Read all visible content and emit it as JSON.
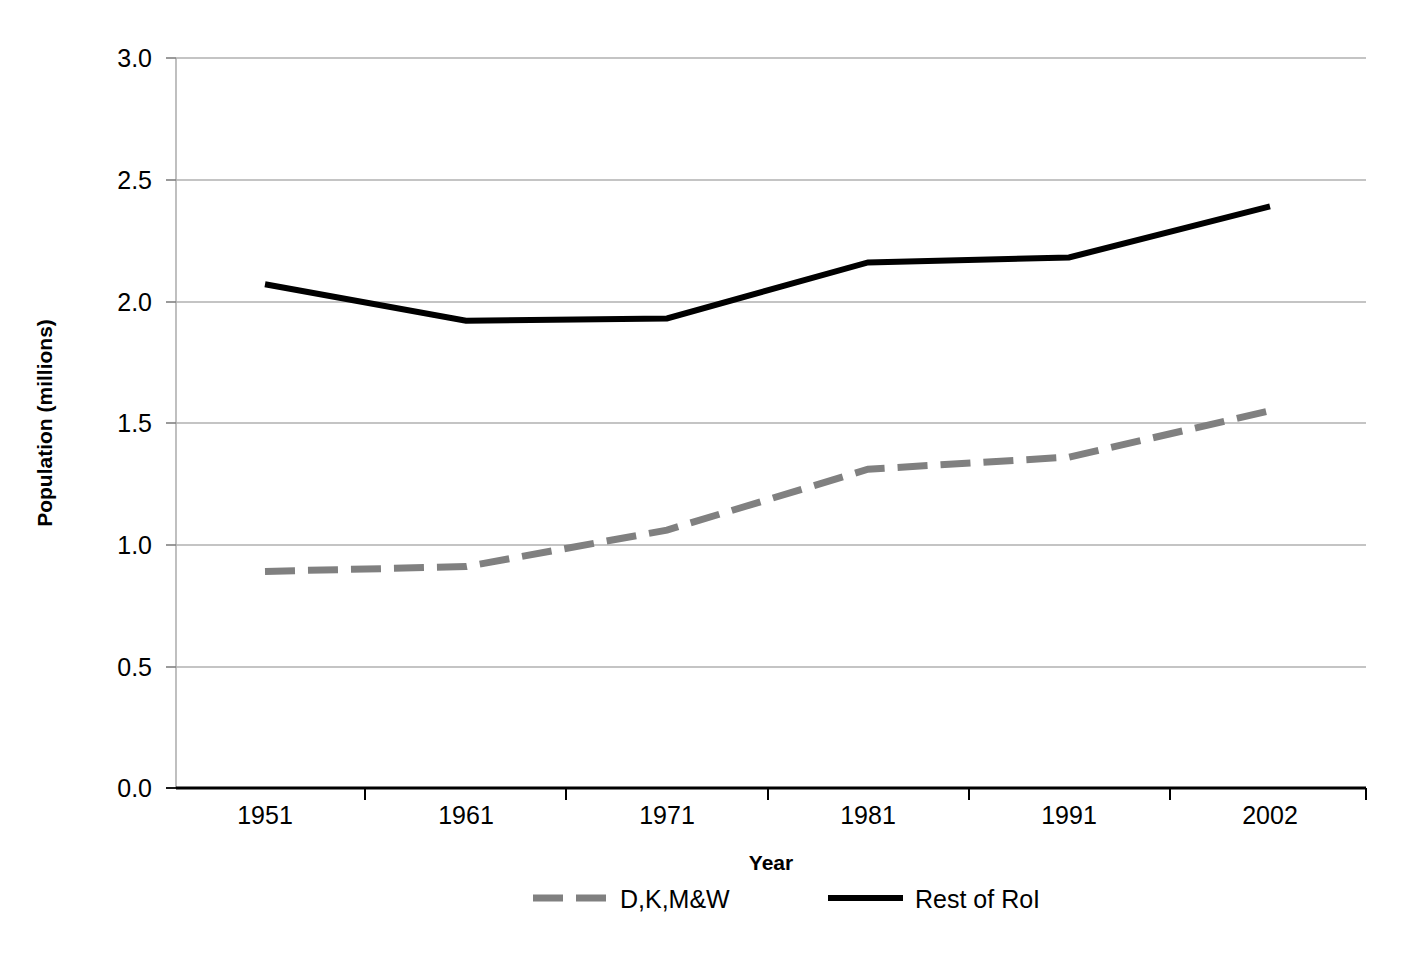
{
  "chart_data": {
    "type": "line",
    "title": "",
    "xlabel": "Year",
    "ylabel": "Population (millions)",
    "categories": [
      "1951",
      "1961",
      "1971",
      "1981",
      "1991",
      "2002"
    ],
    "x": [
      1951,
      1961,
      1971,
      1981,
      1991,
      2002
    ],
    "xtick_labels": [
      "1951",
      "1961",
      "1971",
      "1981",
      "1991",
      "2002"
    ],
    "ytick_labels": [
      "0.0",
      "0.5",
      "1.0",
      "1.5",
      "2.0",
      "2.5",
      "3.0"
    ],
    "yticks": [
      0.0,
      0.5,
      1.0,
      1.5,
      2.0,
      2.5,
      3.0
    ],
    "ylim": [
      0.0,
      3.0
    ],
    "grid": "horizontal",
    "legend_position": "bottom",
    "series": [
      {
        "name": "D,K,M&W",
        "values": [
          0.89,
          0.91,
          1.06,
          1.31,
          1.36,
          1.55
        ],
        "color": "#808080",
        "style": "dashed",
        "width": 7
      },
      {
        "name": "Rest of RoI",
        "values": [
          2.07,
          1.92,
          1.93,
          2.16,
          2.18,
          2.39
        ],
        "color": "#000000",
        "style": "solid",
        "width": 6
      }
    ]
  },
  "legend": {
    "items": [
      {
        "label": "D,K,M&W",
        "color": "#808080",
        "style": "dashed"
      },
      {
        "label": "Rest of RoI",
        "color": "#000000",
        "style": "solid"
      }
    ]
  },
  "axes": {
    "x_title": "Year",
    "y_title": "Population (millions)",
    "y_labels": [
      "3.0",
      "2.5",
      "2.0",
      "1.5",
      "1.0",
      "0.5",
      "0.0"
    ],
    "x_labels": [
      "1951",
      "1961",
      "1971",
      "1981",
      "1991",
      "2002"
    ]
  },
  "colors": {
    "series_primary": "#000000",
    "series_secondary": "#808080",
    "gridline": "#b0b0b0",
    "axis": "#000000",
    "background": "#ffffff"
  }
}
